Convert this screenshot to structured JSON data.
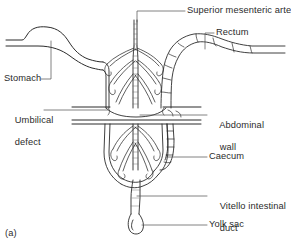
{
  "figure": {
    "caption": "(a)",
    "ink_color": "#2b2b2b",
    "background_color": "#ffffff"
  },
  "labels": {
    "superior_mesenteric_artery": "Superior mesenteric artery",
    "rectum": "Rectum",
    "stomach": "Stomach",
    "umbilical_defect_line1": "Umbilical",
    "umbilical_defect_line2": "defect",
    "abdominal_wall_line1": "Abdominal",
    "abdominal_wall_line2": "wall",
    "caecum": "Caecum",
    "vitello_intestinal_duct_line1": "Vitello intestinal",
    "vitello_intestinal_duct_line2": "duct",
    "yolk_sac": "Yolk sac"
  }
}
